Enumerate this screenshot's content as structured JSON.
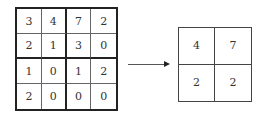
{
  "input_matrix": [
    [
      "3",
      "4",
      "7",
      "2"
    ],
    [
      "2",
      "1",
      "3",
      "0"
    ],
    [
      "1",
      "0",
      "1",
      "2"
    ],
    [
      "2",
      "0",
      "0",
      "0"
    ]
  ],
  "output_matrix": [
    [
      "4",
      "7"
    ],
    [
      "2",
      "2"
    ]
  ],
  "arrow": "right-arrow"
}
